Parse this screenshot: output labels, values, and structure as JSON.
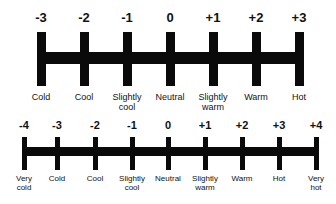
{
  "scales": [
    {
      "name": "seven-point",
      "bar": {
        "left": 37,
        "right": 303
      },
      "ticks": [
        {
          "x": 41,
          "value": "-3",
          "label": "Cold"
        },
        {
          "x": 84,
          "value": "-2",
          "label": "Cool"
        },
        {
          "x": 127,
          "value": "-1",
          "label": "Slightly cool"
        },
        {
          "x": 170,
          "value": "0",
          "label": "Neutral"
        },
        {
          "x": 213,
          "value": "+1",
          "label": "Slightly warm"
        },
        {
          "x": 256,
          "value": "+2",
          "label": "Warm"
        },
        {
          "x": 299,
          "value": "+3",
          "label": "Hot"
        }
      ]
    },
    {
      "name": "nine-point",
      "bar": {
        "left": 22,
        "right": 318
      },
      "ticks": [
        {
          "x": 24,
          "value": "-4",
          "label": "Very cold"
        },
        {
          "x": 57,
          "value": "-3",
          "label": "Cold"
        },
        {
          "x": 95,
          "value": "-2",
          "label": "Cool"
        },
        {
          "x": 132,
          "value": "-1",
          "label": "Slightly cool"
        },
        {
          "x": 168,
          "value": "0",
          "label": "Neutral"
        },
        {
          "x": 205,
          "value": "+1",
          "label": "Slightly warm"
        },
        {
          "x": 242,
          "value": "+2",
          "label": "Warm"
        },
        {
          "x": 279,
          "value": "+3",
          "label": "Hot"
        },
        {
          "x": 316,
          "value": "+4",
          "label": "Very hot"
        }
      ]
    }
  ]
}
